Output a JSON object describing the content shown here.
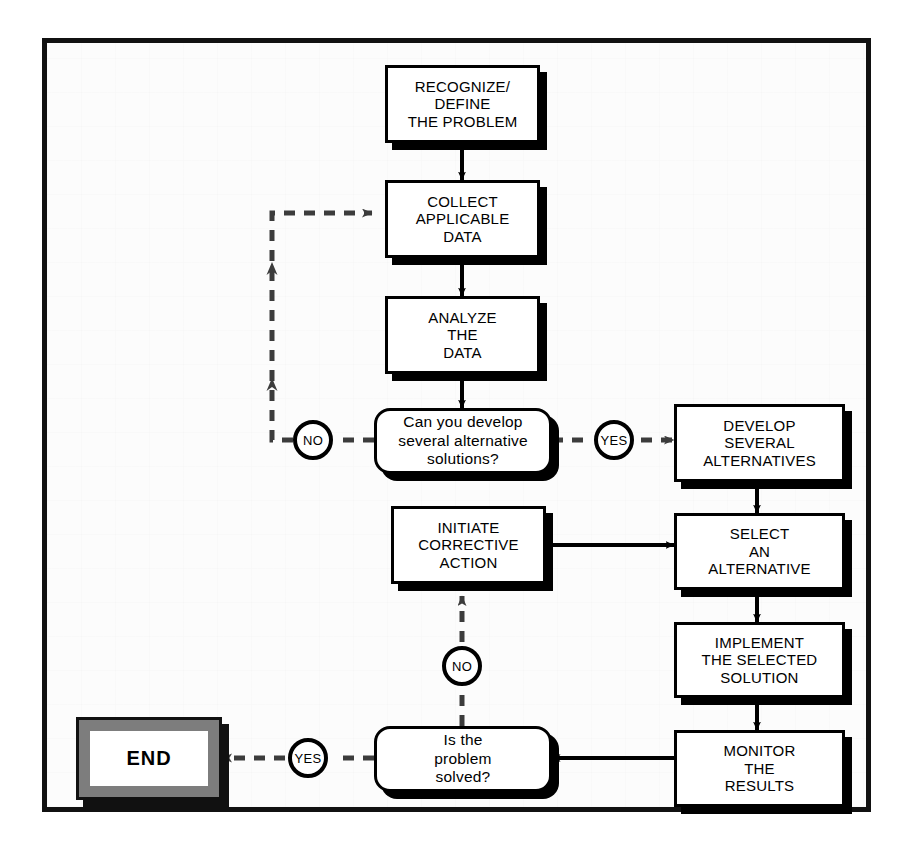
{
  "diagram": {
    "background_color": "#fcfcfc",
    "frame_color": "#111111",
    "node_fill": "#ffffff",
    "node_stroke": "#000000",
    "terminator_frame_color": "#7d7d7d",
    "solid_connector_color": "#000000",
    "dashed_connector_color": "#4a4a4a"
  },
  "nodes": {
    "recognize": {
      "label": "RECOGNIZE/\nDEFINE\nTHE PROBLEM",
      "shape": "process"
    },
    "collect": {
      "label": "COLLECT\nAPPLICABLE\nDATA",
      "shape": "process"
    },
    "analyze": {
      "label": "ANALYZE\nTHE\nDATA",
      "shape": "process"
    },
    "can_develop": {
      "label": "Can you develop\nseveral alternative\nsolutions?",
      "shape": "decision"
    },
    "develop": {
      "label": "DEVELOP\nSEVERAL\nALTERNATIVES",
      "shape": "process"
    },
    "select": {
      "label": "SELECT\nAN\nALTERNATIVE",
      "shape": "process"
    },
    "implement": {
      "label": "IMPLEMENT\nTHE SELECTED\nSOLUTION",
      "shape": "process"
    },
    "monitor": {
      "label": "MONITOR\nTHE\nRESULTS",
      "shape": "process"
    },
    "is_solved": {
      "label": "Is the\nproblem\nsolved?",
      "shape": "decision"
    },
    "initiate": {
      "label": "INITIATE\nCORRECTIVE\nACTION",
      "shape": "process"
    },
    "end": {
      "label": "END",
      "shape": "terminator"
    }
  },
  "labels": {
    "no_develop": "NO",
    "yes_develop": "YES",
    "no_solved": "NO",
    "yes_solved": "YES"
  }
}
